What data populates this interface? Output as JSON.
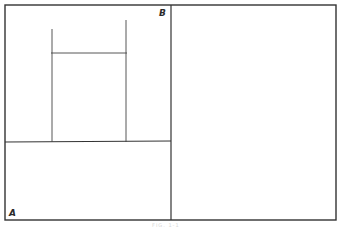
{
  "diagram": {
    "labels": {
      "corner_b": "B",
      "corner_a": "A"
    },
    "caption": "FIG. 1-1",
    "colors": {
      "line": "#333333",
      "background": "#ffffff"
    }
  }
}
